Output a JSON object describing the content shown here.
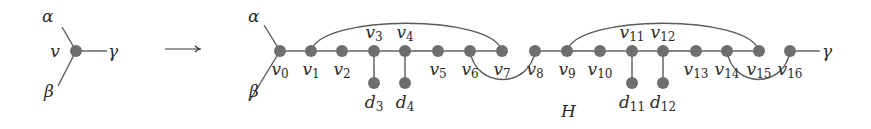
{
  "diagram": {
    "left_graph": {
      "node": {
        "label": "v",
        "x": 76,
        "y": 51
      },
      "edges": [
        {
          "label": "α",
          "to": [
            62,
            27
          ],
          "label_pos": [
            42,
            22
          ]
        },
        {
          "label": "β",
          "to": [
            58,
            86
          ],
          "label_pos": [
            44,
            97
          ]
        },
        {
          "label": "γ",
          "to": [
            107,
            51
          ],
          "label_pos": [
            108,
            57
          ]
        }
      ]
    },
    "arrow": {
      "symbol": "⟶",
      "from": [
        165,
        49
      ],
      "to": [
        201,
        49
      ]
    },
    "right_graph": {
      "name": "H",
      "name_pos": [
        561,
        117
      ],
      "main_y": 51,
      "pendant_y": 83,
      "external_edges": [
        {
          "label": "α",
          "from_node": "v0",
          "to": [
            264,
            25
          ],
          "label_pos": [
            248,
            22
          ]
        },
        {
          "label": "β",
          "from_node": "v0",
          "to": [
            250,
            100
          ],
          "label_pos": [
            249,
            97
          ]
        },
        {
          "label": "γ",
          "from_node": "v16",
          "to": [
            820,
            51
          ],
          "label_pos": [
            822,
            57
          ]
        }
      ],
      "path_nodes": [
        {
          "id": "v0",
          "base": "v",
          "sub": "0",
          "x": 280,
          "label_pos": "below"
        },
        {
          "id": "v1",
          "base": "v",
          "sub": "1",
          "x": 311,
          "label_pos": "below"
        },
        {
          "id": "v2",
          "base": "v",
          "sub": "2",
          "x": 342,
          "label_pos": "below"
        },
        {
          "id": "v3",
          "base": "v",
          "sub": "3",
          "x": 374,
          "label_pos": "above"
        },
        {
          "id": "v4",
          "base": "v",
          "sub": "4",
          "x": 405,
          "label_pos": "above"
        },
        {
          "id": "v5",
          "base": "v",
          "sub": "5",
          "x": 438,
          "label_pos": "below"
        },
        {
          "id": "v6",
          "base": "v",
          "sub": "6",
          "x": 470,
          "label_pos": "below"
        },
        {
          "id": "v7",
          "base": "v",
          "sub": "7",
          "x": 502,
          "label_pos": "below"
        },
        {
          "id": "v8",
          "base": "v",
          "sub": "8",
          "x": 535,
          "label_pos": "below"
        },
        {
          "id": "v9",
          "base": "v",
          "sub": "9",
          "x": 567,
          "label_pos": "below"
        },
        {
          "id": "v10",
          "base": "v",
          "sub": "10",
          "x": 600,
          "label_pos": "below"
        },
        {
          "id": "v11",
          "base": "v",
          "sub": "11",
          "x": 632,
          "label_pos": "above"
        },
        {
          "id": "v12",
          "base": "v",
          "sub": "12",
          "x": 663,
          "label_pos": "above"
        },
        {
          "id": "v13",
          "base": "v",
          "sub": "13",
          "x": 696,
          "label_pos": "below"
        },
        {
          "id": "v14",
          "base": "v",
          "sub": "14",
          "x": 727,
          "label_pos": "below"
        },
        {
          "id": "v15",
          "base": "v",
          "sub": "15",
          "x": 759,
          "label_pos": "below"
        },
        {
          "id": "v16",
          "base": "v",
          "sub": "16",
          "x": 790,
          "label_pos": "below"
        }
      ],
      "path_edges": [
        [
          "v0",
          "v1"
        ],
        [
          "v1",
          "v2"
        ],
        [
          "v2",
          "v3"
        ],
        [
          "v3",
          "v4"
        ],
        [
          "v4",
          "v5"
        ],
        [
          "v5",
          "v6"
        ],
        [
          "v6",
          "v7"
        ],
        [
          "v8",
          "v9"
        ],
        [
          "v9",
          "v10"
        ],
        [
          "v10",
          "v11"
        ],
        [
          "v11",
          "v12"
        ],
        [
          "v12",
          "v13"
        ],
        [
          "v13",
          "v14"
        ],
        [
          "v14",
          "v15"
        ]
      ],
      "pendant_nodes": [
        {
          "id": "d3",
          "base": "d",
          "sub": "3",
          "attached_to": "v3",
          "x": 374
        },
        {
          "id": "d4",
          "base": "d",
          "sub": "4",
          "attached_to": "v4",
          "x": 405
        },
        {
          "id": "d11",
          "base": "d",
          "sub": "11",
          "attached_to": "v11",
          "x": 632
        },
        {
          "id": "d12",
          "base": "d",
          "sub": "12",
          "attached_to": "v12",
          "x": 663
        }
      ],
      "arcs": [
        {
          "from": "v1",
          "to": "v7",
          "side": "above",
          "peak_y": 18
        },
        {
          "from": "v6",
          "to": "v8",
          "side": "below",
          "peak_y": 83
        },
        {
          "from": "v9",
          "to": "v15",
          "side": "above",
          "peak_y": 18
        },
        {
          "from": "v14",
          "to": "v16",
          "side": "below",
          "peak_y": 83
        }
      ]
    }
  }
}
